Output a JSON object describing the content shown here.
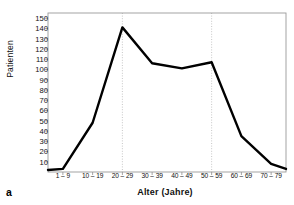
{
  "figure": {
    "panel_label": "a"
  },
  "chart_data": {
    "type": "line",
    "title": "",
    "xlabel": "Alter (Jahre)",
    "ylabel": "Patienten",
    "categories": [
      "1 – 9",
      "10 – 19",
      "20 – 29",
      "30 – 39",
      "40 – 49",
      "50 – 59",
      "60 – 69",
      "70 – 79"
    ],
    "values": [
      3,
      48,
      141,
      106,
      101,
      107,
      35,
      8
    ],
    "series": [
      {
        "name": "Patienten",
        "values": [
          3,
          48,
          141,
          106,
          101,
          107,
          35,
          8
        ],
        "color": "#000000"
      }
    ],
    "ylim": [
      0,
      155
    ],
    "yticks": [
      10,
      20,
      30,
      40,
      50,
      60,
      70,
      80,
      90,
      100,
      110,
      120,
      130,
      140,
      150
    ],
    "ytick_labels": [
      "10",
      "20",
      "30",
      "40",
      "50",
      "60",
      "70",
      "80",
      "90",
      "100",
      "110",
      "120",
      "130",
      "140",
      "150"
    ],
    "grid": "vertical-dotted",
    "gridline_categories": [
      "20 – 29",
      "50 – 59"
    ],
    "legend": "none",
    "line_color": "#000000",
    "line_width": 2.4,
    "frame_color": "#9a9a9a",
    "gridline_color": "#b9b9b9",
    "background": "#ffffff"
  }
}
